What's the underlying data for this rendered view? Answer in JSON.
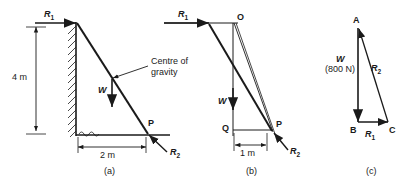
{
  "figure": {
    "background_color": "#ffffff",
    "line_color": "#1a1a1a",
    "panels": [
      {
        "id": "a",
        "caption": "(a)",
        "description": "Ladder leaning against a vertical wall resting on the ground",
        "labels": {
          "reaction_top": "R",
          "reaction_top_sub": "1",
          "reaction_bottom": "R",
          "reaction_bottom_sub": "2",
          "weight": "W",
          "centre_of_gravity_line1": "Centre of",
          "centre_of_gravity_line2": "gravity",
          "point_p": "P",
          "height_dimension": "4 m",
          "base_dimension": "2 m"
        }
      },
      {
        "id": "b",
        "caption": "(b)",
        "description": "Force line diagram with point O above and moment arm from Q to P",
        "labels": {
          "reaction_top": "R",
          "reaction_top_sub": "1",
          "reaction_bottom": "R",
          "reaction_bottom_sub": "2",
          "weight": "W",
          "point_o": "O",
          "point_p": "P",
          "point_q": "Q",
          "arm_dimension": "1 m"
        }
      },
      {
        "id": "c",
        "caption": "(c)",
        "description": "Closed triangle of forces ABC",
        "labels": {
          "vertex_a": "A",
          "vertex_b": "B",
          "vertex_c": "C",
          "weight": "W",
          "weight_value": "(800 N)",
          "reaction_r1": "R",
          "reaction_r1_sub": "1",
          "reaction_r2": "R",
          "reaction_r2_sub": "2"
        }
      }
    ]
  }
}
